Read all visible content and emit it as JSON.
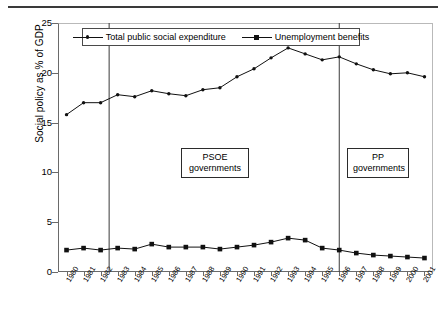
{
  "chart_data": {
    "type": "line",
    "title": "",
    "xlabel": "",
    "ylabel": "Social policy as % of GDP",
    "ylim": [
      0,
      25
    ],
    "yticks": [
      0,
      5,
      10,
      15,
      20,
      25
    ],
    "grid": false,
    "legend_position": "top-center",
    "x": [
      1980,
      1981,
      1982,
      1983,
      1984,
      1985,
      1986,
      1987,
      1988,
      1989,
      1990,
      1991,
      1992,
      1993,
      1994,
      1995,
      1996,
      1997,
      1998,
      1999,
      2000,
      2001
    ],
    "categories": [
      "1980",
      "1981",
      "1982",
      "1983",
      "1984",
      "1985",
      "1986",
      "1987",
      "1988",
      "1989",
      "1990",
      "1991",
      "1992",
      "1993",
      "1994",
      "1995",
      "1996",
      "1997",
      "1998",
      "1999",
      "2000",
      "2001"
    ],
    "series": [
      {
        "name": "Total public social expenditure",
        "marker": "small-dot",
        "values": [
          15.8,
          17.0,
          17.0,
          17.8,
          17.6,
          18.2,
          17.9,
          17.7,
          18.3,
          18.5,
          19.6,
          20.4,
          21.5,
          22.5,
          21.9,
          21.3,
          21.6,
          20.9,
          20.3,
          19.9,
          20.0,
          19.6
        ]
      },
      {
        "name": "Unemployment benefits",
        "marker": "square",
        "values": [
          2.2,
          2.4,
          2.2,
          2.4,
          2.3,
          2.8,
          2.5,
          2.5,
          2.5,
          2.3,
          2.5,
          2.7,
          3.0,
          3.4,
          3.2,
          2.4,
          2.2,
          1.9,
          1.7,
          1.6,
          1.5,
          1.4
        ]
      }
    ],
    "annotations": [
      {
        "id": "psoe",
        "text_line1": "PSOE",
        "text_line2": "governments",
        "x_span": [
          1983,
          1996
        ]
      },
      {
        "id": "pp",
        "text_line1": "PP",
        "text_line2": "governments",
        "x_span": [
          1996,
          2001
        ]
      }
    ],
    "reference_lines": [
      {
        "x": 1982.5,
        "label": "PSOE start"
      },
      {
        "x": 1996.0,
        "label": "PP start"
      }
    ]
  },
  "legend": {
    "items": [
      {
        "label": "Total public social expenditure",
        "marker": "small-dot"
      },
      {
        "label": "Unemployment benefits",
        "marker": "square"
      }
    ]
  },
  "annotations": {
    "psoe": {
      "line1": "PSOE",
      "line2": "governments"
    },
    "pp": {
      "line1": "PP",
      "line2": "governments"
    }
  },
  "axis": {
    "y_title": "Social policy as % of GDP",
    "y_ticks": [
      "0",
      "5",
      "10",
      "15",
      "20",
      "25"
    ],
    "x_ticks": [
      "1980",
      "1981",
      "1982",
      "1983",
      "1984",
      "1985",
      "1986",
      "1987",
      "1988",
      "1989",
      "1990",
      "1991",
      "1992",
      "1993",
      "1994",
      "1995",
      "1996",
      "1997",
      "1998",
      "1999",
      "2000",
      "2001"
    ]
  },
  "colors": {
    "line": "#111111",
    "frame": "#6a6a6a",
    "rule": "#3a3a3a"
  }
}
